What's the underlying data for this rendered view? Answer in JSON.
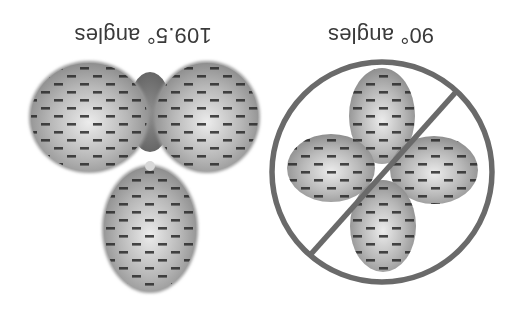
{
  "figure": {
    "orientation": "rotated-180",
    "left_panel": {
      "label": "109.5° angles",
      "lobe_count": 3,
      "description": "tetrahedral arrangement of electron-cloud lobes"
    },
    "right_panel": {
      "label": "90° angles",
      "lobe_count": 4,
      "description": "square-planar arrangement of lobes crossed out",
      "prohibited_symbol": true
    },
    "colors": {
      "background": "#ffffff",
      "lobe_fill_light": "#e2e2e2",
      "lobe_fill_dark": "#8a8a8a",
      "electron_dash": "#2a2a2a",
      "prohibit_ring": "#6a6a6a",
      "label_text": "#3a3a3a"
    },
    "electron_symbol": "−"
  }
}
